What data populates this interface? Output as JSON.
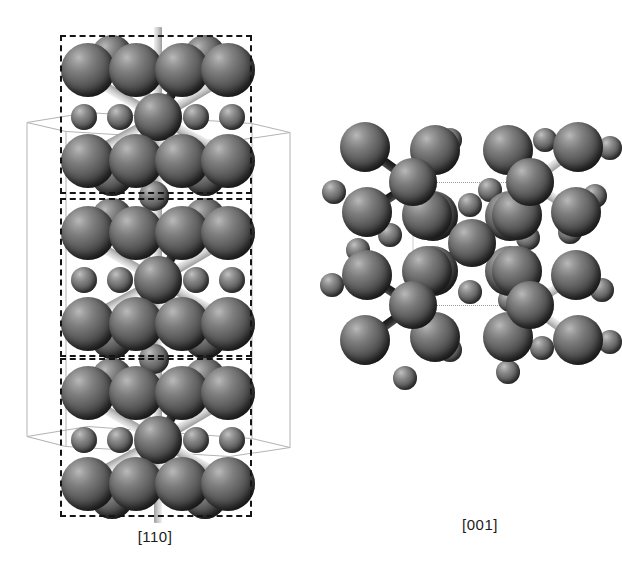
{
  "figure": {
    "type": "crystal-structure-projection-figure",
    "background_color": "#ffffff",
    "panels": [
      {
        "id": "left",
        "caption": "[110]",
        "projection": "[110]",
        "cell_outline": "dashed-rectangles-plus-thin-perspective-cell",
        "repeat_units": 3
      },
      {
        "id": "right",
        "caption": "[001]",
        "projection": "[001]",
        "cell_outline": "dotted-square",
        "repeat_units": 1
      }
    ],
    "species": [
      {
        "name": "large-atom",
        "radius_px": 26,
        "color": "#4c4c4c"
      },
      {
        "name": "small-atom",
        "radius_px": 13,
        "color": "#6b6b6b"
      }
    ]
  },
  "captions": {
    "left": "[110]",
    "right": "[001]"
  },
  "chart_data": {
    "type": "scatter",
    "title": "",
    "xlabel": "",
    "ylabel": "",
    "note": "Ball-and-stick crystal structure viewed along two directions.",
    "series": [
      {
        "name": "large-atom",
        "marker": "sphere",
        "size": 52,
        "color": "#4c4c4c"
      },
      {
        "name": "small-atom",
        "marker": "sphere",
        "size": 26,
        "color": "#6b6b6b"
      }
    ],
    "legend": [
      "[110]",
      "[001]"
    ],
    "legend_position": "bottom"
  }
}
